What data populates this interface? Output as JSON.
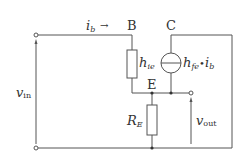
{
  "diagram": {
    "colors": {
      "wire": "#555555",
      "text": "#333333",
      "background": "#ffffff"
    },
    "nodes": {
      "base": "B",
      "collector": "C",
      "emitter": "E"
    },
    "labels": {
      "ib_main": "i",
      "ib_sub": "b",
      "ib_arrow": "→",
      "hie_main": "h",
      "hie_sub": "ie",
      "hfe_main": "h",
      "hfe_sub": "fe",
      "hfe_dot": "•",
      "hfe_ib_main": "i",
      "hfe_ib_sub": "b",
      "re_main": "R",
      "re_sub": "E",
      "vin_main": "v",
      "vin_sub": "in",
      "vout_main": "v",
      "vout_sub": "out"
    },
    "components": [
      {
        "id": "hie",
        "type": "resistor",
        "label": "h_ie",
        "between": [
          "B",
          "E"
        ]
      },
      {
        "id": "hfe_source",
        "type": "current-source",
        "label": "h_fe·i_b",
        "between": [
          "C",
          "E"
        ]
      },
      {
        "id": "RE",
        "type": "resistor",
        "label": "R_E",
        "between": [
          "E",
          "ground"
        ]
      }
    ],
    "terminals": [
      "vin+",
      "vin-",
      "vout"
    ]
  }
}
